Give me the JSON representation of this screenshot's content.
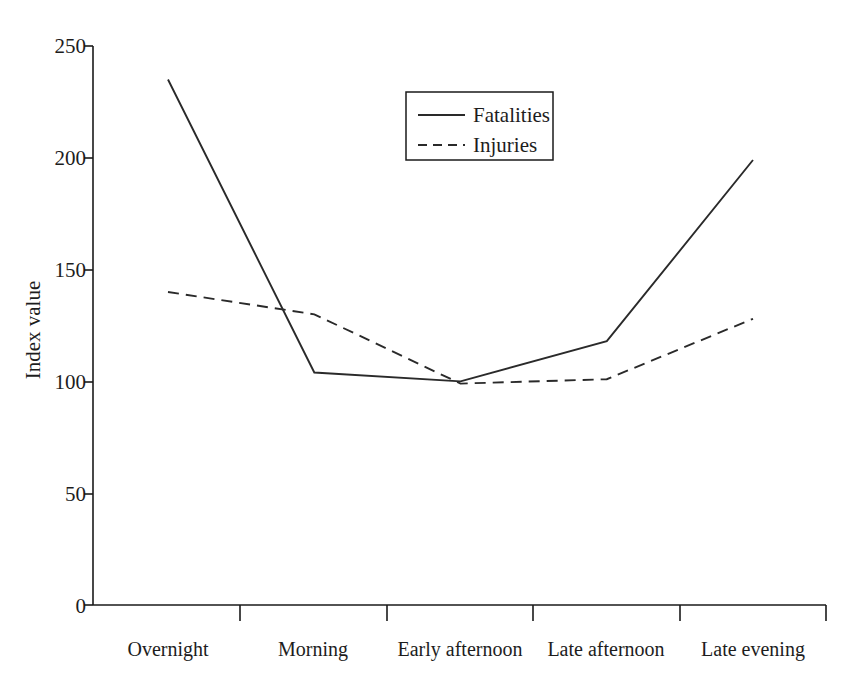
{
  "chart_data": {
    "type": "line",
    "title": "",
    "xlabel": "",
    "ylabel": "Index value",
    "categories": [
      "Overnight",
      "Morning",
      "Early afternoon",
      "Late afternoon",
      "Late evening"
    ],
    "series": [
      {
        "name": "Fatalities",
        "style": "solid",
        "values": [
          235,
          104,
          100,
          118,
          199
        ]
      },
      {
        "name": "Injuries",
        "style": "dashed",
        "values": [
          140,
          130,
          99,
          101,
          128
        ]
      }
    ],
    "ylim": [
      0,
      250
    ],
    "yticks": [
      0,
      50,
      100,
      150,
      200,
      250
    ],
    "ytick_labels": [
      "0",
      "50",
      "100",
      "150",
      "200",
      "250"
    ],
    "grid": false,
    "legend_position": "top-center",
    "legend_entries": [
      {
        "label": "Fatalities",
        "style": "solid"
      },
      {
        "label": "Injuries",
        "style": "dashed"
      }
    ],
    "colors": {
      "line": "#2a2a2a",
      "axis": "#1a1a1a",
      "text": "#1d1d1d",
      "background": "#ffffff"
    }
  },
  "axes": {
    "y_title": "Index value"
  }
}
